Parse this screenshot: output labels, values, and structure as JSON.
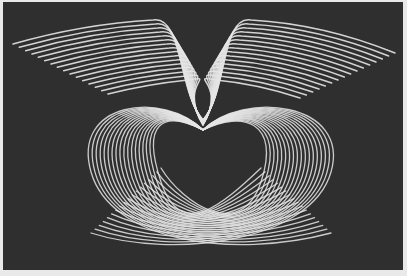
{
  "figure": {
    "alt": "Wireframe line-art figure of a pair of wings above a heart-shaped lattice body",
    "colors": {
      "background": "#2f2f2f",
      "border": "#e9e9e9",
      "line": "#e6e6e6"
    },
    "center_x": 200,
    "wings": {
      "feather_count": 16,
      "left_tip": [
        10,
        42
      ],
      "right_tip": [
        392,
        51
      ],
      "left_shoulder": [
        150,
        18
      ],
      "right_shoulder": [
        248,
        18
      ]
    },
    "body": {
      "ring_count": 18,
      "left_extent": 88,
      "right_extent": 328,
      "bottom": 251,
      "neck_y": 128
    }
  }
}
